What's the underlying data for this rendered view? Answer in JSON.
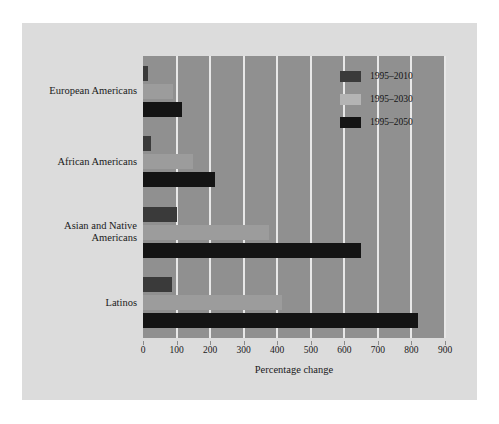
{
  "chart_data": {
    "type": "bar",
    "orientation": "horizontal",
    "title": "",
    "xlabel": "Percentage change",
    "ylabel": "",
    "xlim": [
      0,
      900
    ],
    "xticks": [
      0,
      100,
      200,
      300,
      400,
      500,
      600,
      700,
      800,
      900
    ],
    "grid": true,
    "legend_position": "top-right",
    "categories": [
      "European Americans",
      "African Americans",
      "Asian and Native Americans",
      "Latinos"
    ],
    "category_lines": [
      [
        "European Americans"
      ],
      [
        "African Americans"
      ],
      [
        "Asian and Native",
        "Americans"
      ],
      [
        "Latinos"
      ]
    ],
    "series": [
      {
        "name": "1995–2010",
        "color": "#3a3a3a",
        "values": [
          15,
          25,
          100,
          85
        ]
      },
      {
        "name": "1995–2030",
        "color": "#9c9c9c",
        "values": [
          90,
          150,
          375,
          415
        ]
      },
      {
        "name": "1995–2050",
        "color": "#141414",
        "values": [
          115,
          215,
          650,
          820
        ]
      }
    ]
  },
  "figure": {
    "background": "#dcdcdc",
    "plot_background": "#909090",
    "gridline_color": "#e8e8e8"
  }
}
